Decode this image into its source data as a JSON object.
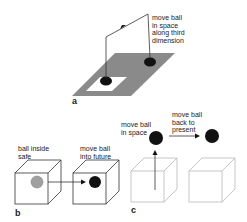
{
  "panels": {
    "a": {
      "letter": "a",
      "label": "move ball\nin space\nalong third\ndimension"
    },
    "b": {
      "letter": "b",
      "label_left": "ball inside\nsafe",
      "label_right": "move ball\ninto future"
    },
    "c": {
      "letter": "c",
      "label_left": "move ball\nin space",
      "label_right": "move ball\nback to\npresent"
    }
  },
  "colors": {
    "plane": "#8a8a8a",
    "ball_dark": "#111111",
    "ball_gray": "#a0a0a0",
    "line": "#333333",
    "faint_box": "#b8b8b8"
  }
}
